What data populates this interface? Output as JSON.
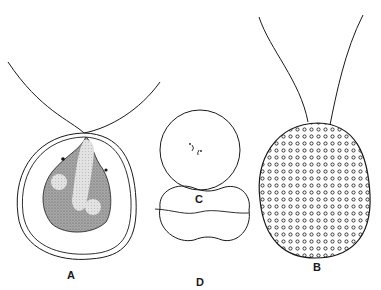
{
  "figure": {
    "type": "biological line illustration",
    "colors": {
      "background": "#ffffff",
      "ink": "#1a1a1a",
      "cytoplasm_stipple": "#8c8c8c",
      "pale_region": "#d4d4d4"
    },
    "panels": [
      {
        "id": "A",
        "label": "A",
        "description": "flagellate cell with two flagella, pear-shaped protoplast enclosed in double-walled envelope, with pale inclusions and dark stigma dots"
      },
      {
        "id": "B",
        "label": "B",
        "description": "oval cell with two long flagella, surface covered with small ring-shaped granules"
      },
      {
        "id": "C",
        "label": "C",
        "description": "circular cell with small marks in center"
      },
      {
        "id": "D",
        "label": "D",
        "description": "dumbbell / kidney-shaped outline with a wavy median line"
      }
    ]
  }
}
